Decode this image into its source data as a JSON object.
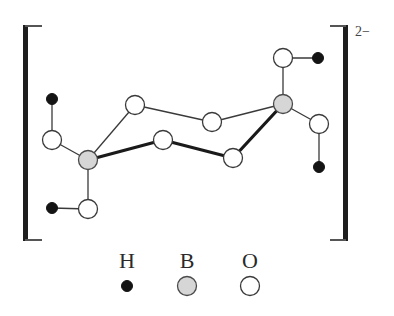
{
  "diagram": {
    "title": "",
    "charge": "2−",
    "colors": {
      "H": "#141414",
      "B": "#d6d6d6",
      "O": "#ffffff",
      "outline": "#3a3a3a"
    },
    "atoms": [
      {
        "id": "H1",
        "element": "H",
        "x": 52,
        "y": 99
      },
      {
        "id": "O1",
        "element": "O",
        "x": 52,
        "y": 140
      },
      {
        "id": "B1",
        "element": "B",
        "x": 88,
        "y": 160
      },
      {
        "id": "H2",
        "element": "H",
        "x": 52,
        "y": 208
      },
      {
        "id": "O2",
        "element": "O",
        "x": 88,
        "y": 209
      },
      {
        "id": "O3",
        "element": "O",
        "x": 135,
        "y": 105
      },
      {
        "id": "O4",
        "element": "O",
        "x": 163,
        "y": 140
      },
      {
        "id": "O5",
        "element": "O",
        "x": 212,
        "y": 122
      },
      {
        "id": "O6",
        "element": "O",
        "x": 233,
        "y": 158
      },
      {
        "id": "B2",
        "element": "B",
        "x": 283,
        "y": 104
      },
      {
        "id": "O7",
        "element": "O",
        "x": 283,
        "y": 58
      },
      {
        "id": "H3",
        "element": "H",
        "x": 318,
        "y": 58
      },
      {
        "id": "O8",
        "element": "O",
        "x": 319,
        "y": 124
      },
      {
        "id": "H4",
        "element": "H",
        "x": 319,
        "y": 167
      }
    ],
    "bonds": [
      {
        "from": "H1",
        "to": "O1",
        "style": "thin"
      },
      {
        "from": "O1",
        "to": "B1",
        "style": "thin"
      },
      {
        "from": "B1",
        "to": "O2",
        "style": "thin"
      },
      {
        "from": "O2",
        "to": "H2",
        "style": "thin"
      },
      {
        "from": "B1",
        "to": "O3",
        "style": "thin"
      },
      {
        "from": "B1",
        "to": "O4",
        "style": "bold"
      },
      {
        "from": "O3",
        "to": "O5",
        "style": "thin"
      },
      {
        "from": "O4",
        "to": "O6",
        "style": "bold"
      },
      {
        "from": "O5",
        "to": "B2",
        "style": "thin"
      },
      {
        "from": "O6",
        "to": "B2",
        "style": "bold"
      },
      {
        "from": "B2",
        "to": "O7",
        "style": "thin"
      },
      {
        "from": "O7",
        "to": "H3",
        "style": "thin"
      },
      {
        "from": "B2",
        "to": "O8",
        "style": "thin"
      },
      {
        "from": "O8",
        "to": "H4",
        "style": "thin"
      }
    ],
    "legend": [
      {
        "element": "H",
        "label": "H",
        "x": 127
      },
      {
        "element": "B",
        "label": "B",
        "x": 187
      },
      {
        "element": "O",
        "label": "O",
        "x": 250
      }
    ]
  }
}
